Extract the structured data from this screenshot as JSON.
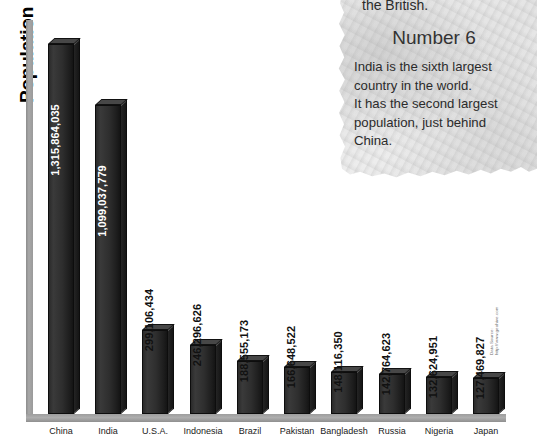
{
  "chart_data": {
    "type": "bar",
    "title": "",
    "xlabel": "",
    "ylabel": "Population",
    "categories": [
      "China",
      "India",
      "U.S.A.",
      "Indonesia",
      "Brazil",
      "Pakistan",
      "Bangladesh",
      "Russia",
      "Nigeria",
      "Japan"
    ],
    "values": [
      1315864035,
      1099037779,
      299106434,
      246296626,
      188555173,
      166648522,
      148116350,
      142764623,
      132624951,
      127469827
    ],
    "value_labels": [
      "1,315,864,035",
      "1,099,037,779",
      "299,106,434",
      "246,296,626",
      "188,555,173",
      "166,648,522",
      "148,116,350",
      "142,764,623",
      "132,624,951",
      "127,469,827"
    ],
    "label_placement": [
      "inside",
      "inside",
      "outside",
      "outside",
      "outside",
      "outside",
      "outside",
      "outside",
      "outside",
      "outside"
    ],
    "ylim": [
      0,
      1400000000
    ],
    "grid": false,
    "legend": null,
    "bar_color": "#2b2b2b",
    "axis_color": "#a0a0a0"
  },
  "axis": {
    "y_label": "Population"
  },
  "source": {
    "line1": "Data Source:",
    "line2": "http://www.geohive.com"
  },
  "paper": {
    "top_fragment": "the British.",
    "heading": "Number 6",
    "body_lines": [
      "India is the sixth largest",
      "country in the world.",
      "It has the second largest",
      "population, just behind",
      "China."
    ]
  }
}
